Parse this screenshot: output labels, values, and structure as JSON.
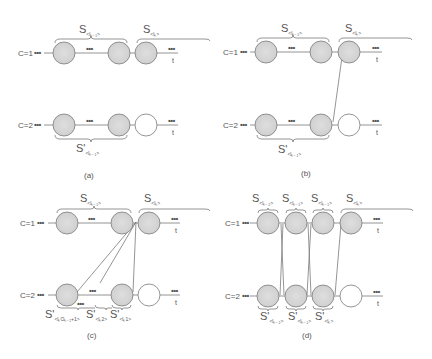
{
  "colors": {
    "filled_circle": "#d9d9d9",
    "empty_circle": "#ffffff",
    "stroke": "#7a7a7a",
    "text": "#555555"
  },
  "rows": {
    "top_label": "C=1",
    "bottom_label": "C=2",
    "ellipsis": "•••",
    "t_label": "t"
  },
  "panels": [
    {
      "caption": "(a)",
      "top_braces": [
        {
          "main": "S",
          "sub": "<lₖ₋₁>"
        },
        {
          "main": "S",
          "sub": "<lₖ>"
        }
      ],
      "bottom_braces": [
        {
          "main": "S'",
          "sub": "<lₖ₋₁>"
        }
      ]
    },
    {
      "caption": "(b)",
      "top_braces": [
        {
          "main": "S",
          "sub": "<lₖ₋₁>"
        },
        {
          "main": "S",
          "sub": "<lₖ>"
        }
      ],
      "bottom_braces": [
        {
          "main": "S'",
          "sub": "<lₖ₋₁>"
        }
      ]
    },
    {
      "caption": "(c)",
      "top_braces": [
        {
          "main": "S",
          "sub": "<lₖ₋₁>"
        },
        {
          "main": "S",
          "sub": "<lₖ>"
        }
      ],
      "bottom_braces": [
        {
          "main": "S'",
          "sub": "<lₖOₖ₋₁+1>"
        },
        {
          "main": "S'",
          "sub": "<lₖ2>"
        },
        {
          "main": "S'",
          "sub": "<lₖ1>"
        }
      ]
    },
    {
      "caption": "(d)",
      "top_braces": [
        {
          "main": "S",
          "sub": "<lₖ₋₂>"
        },
        {
          "main": "S",
          "sub": "<lₖ₋₁>"
        },
        {
          "main": "S",
          "sub": "<lₖ₋₁>"
        },
        {
          "main": "S",
          "sub": "<lₖ>"
        }
      ],
      "bottom_braces": [
        {
          "main": "S'",
          "sub": "<lₖ₋₂>"
        },
        {
          "main": "S'",
          "sub": "<lₖ₋₁>"
        },
        {
          "main": "S'",
          "sub": "<lₖ>"
        }
      ]
    }
  ]
}
